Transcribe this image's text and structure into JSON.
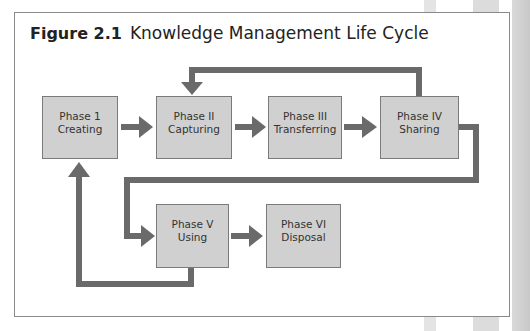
{
  "figure": {
    "number": "Figure 2.1",
    "title": "Knowledge Management Life Cycle"
  },
  "colors": {
    "box_fill": "#d0d0d0",
    "box_border": "#7a7a7a",
    "arrow": "#6a6a6a",
    "frame_border": "#8a8a8a"
  },
  "phases": [
    {
      "id": "phase-1",
      "label": "Phase 1",
      "name": "Creating"
    },
    {
      "id": "phase-2",
      "label": "Phase II",
      "name": "Capturing"
    },
    {
      "id": "phase-3",
      "label": "Phase III",
      "name": "Transferring"
    },
    {
      "id": "phase-4",
      "label": "Phase IV",
      "name": "Sharing"
    },
    {
      "id": "phase-5",
      "label": "Phase V",
      "name": "Using"
    },
    {
      "id": "phase-6",
      "label": "Phase VI",
      "name": "Disposal"
    }
  ],
  "connections": [
    {
      "from": "Phase 1",
      "to": "Phase II"
    },
    {
      "from": "Phase II",
      "to": "Phase III"
    },
    {
      "from": "Phase III",
      "to": "Phase IV"
    },
    {
      "from": "Phase IV",
      "to": "Phase II",
      "route": "loop over top"
    },
    {
      "from": "Phase IV",
      "to": "Phase V",
      "route": "down and back left"
    },
    {
      "from": "Phase V",
      "to": "Phase VI"
    },
    {
      "from": "Phase V",
      "to": "Phase 1",
      "route": "loop under bottom"
    }
  ]
}
